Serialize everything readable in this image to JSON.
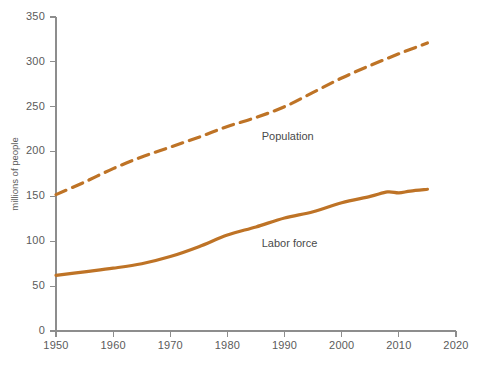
{
  "chart_data": {
    "type": "line",
    "title": "",
    "xlabel": "",
    "ylabel": "millions of people",
    "xlim": [
      1950,
      2020
    ],
    "ylim": [
      0,
      350
    ],
    "xticks": [
      1950,
      1960,
      1970,
      1980,
      1990,
      2000,
      2010,
      2020
    ],
    "yticks": [
      0,
      50,
      100,
      150,
      200,
      250,
      300,
      350
    ],
    "grid": false,
    "legend_position": "inline-annotation",
    "series": [
      {
        "name": "Population",
        "style": "dashed",
        "color": "#BE7326",
        "label_x": 1986,
        "label_y": 216,
        "x": [
          1950,
          1955,
          1960,
          1965,
          1970,
          1975,
          1980,
          1985,
          1990,
          1995,
          2000,
          2005,
          2010,
          2015
        ],
        "values": [
          152,
          166,
          181,
          194,
          205,
          216,
          228,
          238,
          250,
          266,
          282,
          296,
          309,
          321
        ]
      },
      {
        "name": "Labor force",
        "style": "solid",
        "color": "#BE7326",
        "label_x": 1986,
        "label_y": 97,
        "x": [
          1950,
          1955,
          1960,
          1965,
          1970,
          1975,
          1980,
          1985,
          1990,
          1995,
          2000,
          2005,
          2008,
          2010,
          2012,
          2015
        ],
        "values": [
          62,
          66,
          70,
          75,
          83,
          94,
          107,
          116,
          126,
          133,
          143,
          150,
          155,
          154,
          156,
          158
        ]
      }
    ]
  },
  "axis": {
    "y_title": "millions of people",
    "y_tick_labels": [
      "0",
      "50",
      "100",
      "150",
      "200",
      "250",
      "300",
      "350"
    ],
    "x_tick_labels": [
      "1950",
      "1960",
      "1970",
      "1980",
      "1990",
      "2000",
      "2010",
      "2020"
    ]
  },
  "annotations": {
    "population_label": "Population",
    "labor_force_label": "Labor force"
  },
  "colors": {
    "series": "#BE7326",
    "axis": "#8d8d8d",
    "text": "#5b5b5b",
    "background": "#ffffff"
  }
}
